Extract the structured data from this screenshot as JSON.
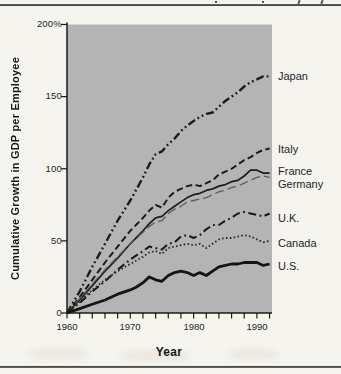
{
  "chart_data": {
    "type": "line",
    "title": "",
    "ylabel": "Cumulative Growth in GDP per Employee",
    "xlabel": "Year",
    "ylim": [
      0,
      200
    ],
    "xlim": [
      1960,
      1992
    ],
    "grid": false,
    "legend_position": "right-edge-labels",
    "plot_background": "#b4b4b4",
    "axis_color": "#1b1b1b",
    "y_unit": "%",
    "y_ticks": [
      {
        "value": 200,
        "label": "200%"
      },
      {
        "value": 150,
        "label": "150"
      },
      {
        "value": 100,
        "label": "100"
      },
      {
        "value": 50,
        "label": "50"
      },
      {
        "value": 0,
        "label": "0"
      }
    ],
    "x_ticks": [
      {
        "value": 1960,
        "label": "1960"
      },
      {
        "value": 1970,
        "label": "1970"
      },
      {
        "value": 1980,
        "label": "1980"
      },
      {
        "value": 1990,
        "label": "1990"
      }
    ],
    "x_minor_tick_step": 2,
    "series": [
      {
        "name": "Japan",
        "line_style": "dash-dot-dot",
        "color": "#1c1c1c",
        "width": 2.4,
        "dash": "8 3 1.8 3 1.8 3",
        "label_y": 76,
        "points": [
          [
            1960,
            0
          ],
          [
            1962,
            15
          ],
          [
            1964,
            32
          ],
          [
            1966,
            48
          ],
          [
            1968,
            64
          ],
          [
            1970,
            78
          ],
          [
            1972,
            94
          ],
          [
            1973,
            103
          ],
          [
            1974,
            110
          ],
          [
            1975,
            112
          ],
          [
            1976,
            117
          ],
          [
            1977,
            121
          ],
          [
            1978,
            126
          ],
          [
            1979,
            130
          ],
          [
            1980,
            133
          ],
          [
            1981,
            136
          ],
          [
            1982,
            138
          ],
          [
            1983,
            139
          ],
          [
            1984,
            143
          ],
          [
            1985,
            147
          ],
          [
            1986,
            150
          ],
          [
            1987,
            153
          ],
          [
            1988,
            157
          ],
          [
            1989,
            160
          ],
          [
            1990,
            162
          ],
          [
            1991,
            164
          ],
          [
            1992,
            164
          ]
        ]
      },
      {
        "name": "Italy",
        "line_style": "dashed",
        "color": "#1c1c1c",
        "width": 2.0,
        "dash": "6.5 3.5",
        "label_y": 149,
        "points": [
          [
            1960,
            0
          ],
          [
            1962,
            11
          ],
          [
            1964,
            23
          ],
          [
            1966,
            35
          ],
          [
            1968,
            46
          ],
          [
            1970,
            57
          ],
          [
            1972,
            66
          ],
          [
            1973,
            71
          ],
          [
            1974,
            75
          ],
          [
            1975,
            73
          ],
          [
            1976,
            80
          ],
          [
            1977,
            84
          ],
          [
            1978,
            86
          ],
          [
            1979,
            88
          ],
          [
            1980,
            89
          ],
          [
            1981,
            88
          ],
          [
            1982,
            90
          ],
          [
            1983,
            92
          ],
          [
            1984,
            96
          ],
          [
            1985,
            98
          ],
          [
            1986,
            100
          ],
          [
            1987,
            103
          ],
          [
            1988,
            106
          ],
          [
            1989,
            108
          ],
          [
            1990,
            111
          ],
          [
            1991,
            113
          ],
          [
            1992,
            114
          ]
        ]
      },
      {
        "name": "France",
        "line_style": "solid",
        "color": "#1c1c1c",
        "width": 1.7,
        "dash": "",
        "label_y": 172,
        "points": [
          [
            1960,
            0
          ],
          [
            1962,
            9
          ],
          [
            1964,
            19
          ],
          [
            1966,
            29
          ],
          [
            1968,
            38
          ],
          [
            1970,
            48
          ],
          [
            1972,
            57
          ],
          [
            1973,
            62
          ],
          [
            1974,
            66
          ],
          [
            1975,
            67
          ],
          [
            1976,
            71
          ],
          [
            1977,
            74
          ],
          [
            1978,
            77
          ],
          [
            1979,
            80
          ],
          [
            1980,
            82
          ],
          [
            1981,
            83
          ],
          [
            1982,
            85
          ],
          [
            1983,
            86
          ],
          [
            1984,
            88
          ],
          [
            1985,
            89
          ],
          [
            1986,
            91
          ],
          [
            1987,
            92
          ],
          [
            1988,
            95
          ],
          [
            1989,
            99
          ],
          [
            1990,
            99
          ],
          [
            1991,
            97
          ],
          [
            1992,
            97
          ]
        ]
      },
      {
        "name": "Germany",
        "line_style": "long-dash",
        "color": "#5c5c5c",
        "width": 1.3,
        "dash": "9 4",
        "label_y": 184,
        "points": [
          [
            1960,
            0
          ],
          [
            1962,
            10
          ],
          [
            1964,
            20
          ],
          [
            1966,
            30
          ],
          [
            1968,
            39
          ],
          [
            1970,
            48
          ],
          [
            1972,
            56
          ],
          [
            1973,
            60
          ],
          [
            1974,
            63
          ],
          [
            1975,
            64
          ],
          [
            1976,
            69
          ],
          [
            1977,
            72
          ],
          [
            1978,
            74
          ],
          [
            1979,
            77
          ],
          [
            1980,
            78
          ],
          [
            1981,
            79
          ],
          [
            1982,
            80
          ],
          [
            1983,
            82
          ],
          [
            1984,
            84
          ],
          [
            1985,
            85
          ],
          [
            1986,
            87
          ],
          [
            1987,
            88
          ],
          [
            1988,
            90
          ],
          [
            1989,
            92
          ],
          [
            1990,
            94
          ],
          [
            1991,
            95
          ],
          [
            1992,
            94
          ]
        ]
      },
      {
        "name": "U.K.",
        "line_style": "dash-dot",
        "color": "#1c1c1c",
        "width": 2.1,
        "dash": "8 3.5 1.8 3.5",
        "label_y": 218,
        "points": [
          [
            1960,
            0
          ],
          [
            1962,
            7
          ],
          [
            1964,
            15
          ],
          [
            1966,
            22
          ],
          [
            1968,
            30
          ],
          [
            1970,
            37
          ],
          [
            1972,
            43
          ],
          [
            1973,
            46
          ],
          [
            1974,
            45
          ],
          [
            1975,
            44
          ],
          [
            1976,
            48
          ],
          [
            1977,
            49
          ],
          [
            1978,
            53
          ],
          [
            1979,
            54
          ],
          [
            1980,
            52
          ],
          [
            1981,
            54
          ],
          [
            1982,
            58
          ],
          [
            1983,
            61
          ],
          [
            1984,
            61
          ],
          [
            1985,
            64
          ],
          [
            1986,
            66
          ],
          [
            1987,
            69
          ],
          [
            1988,
            70
          ],
          [
            1989,
            69
          ],
          [
            1990,
            68
          ],
          [
            1991,
            67
          ],
          [
            1992,
            69
          ]
        ]
      },
      {
        "name": "Canada",
        "line_style": "dotted",
        "color": "#2a2a2a",
        "width": 1.8,
        "dash": "1.6 2.3",
        "label_y": 243,
        "points": [
          [
            1960,
            0
          ],
          [
            1962,
            8
          ],
          [
            1964,
            16
          ],
          [
            1966,
            23
          ],
          [
            1968,
            29
          ],
          [
            1970,
            34
          ],
          [
            1972,
            39
          ],
          [
            1973,
            42
          ],
          [
            1974,
            43
          ],
          [
            1975,
            41
          ],
          [
            1976,
            45
          ],
          [
            1977,
            46
          ],
          [
            1978,
            47
          ],
          [
            1979,
            48
          ],
          [
            1980,
            47
          ],
          [
            1981,
            48
          ],
          [
            1982,
            45
          ],
          [
            1983,
            48
          ],
          [
            1984,
            51
          ],
          [
            1985,
            52
          ],
          [
            1986,
            52
          ],
          [
            1987,
            53
          ],
          [
            1988,
            54
          ],
          [
            1989,
            53
          ],
          [
            1990,
            51
          ],
          [
            1991,
            49
          ],
          [
            1992,
            50
          ]
        ]
      },
      {
        "name": "U.S.",
        "line_style": "thick-solid",
        "color": "#141414",
        "width": 2.8,
        "dash": "",
        "label_y": 266,
        "points": [
          [
            1960,
            0
          ],
          [
            1962,
            3
          ],
          [
            1964,
            6
          ],
          [
            1966,
            9
          ],
          [
            1968,
            13
          ],
          [
            1970,
            16
          ],
          [
            1971,
            18
          ],
          [
            1972,
            21
          ],
          [
            1973,
            25
          ],
          [
            1974,
            23
          ],
          [
            1975,
            22
          ],
          [
            1976,
            26
          ],
          [
            1977,
            28
          ],
          [
            1978,
            29
          ],
          [
            1979,
            28
          ],
          [
            1980,
            26
          ],
          [
            1981,
            28
          ],
          [
            1982,
            26
          ],
          [
            1983,
            29
          ],
          [
            1984,
            32
          ],
          [
            1985,
            33
          ],
          [
            1986,
            34
          ],
          [
            1987,
            34
          ],
          [
            1988,
            35
          ],
          [
            1989,
            35
          ],
          [
            1990,
            35
          ],
          [
            1991,
            33
          ],
          [
            1992,
            34
          ]
        ]
      }
    ]
  }
}
